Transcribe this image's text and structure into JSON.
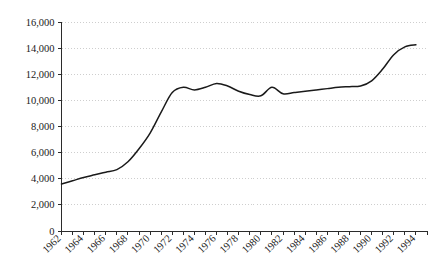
{
  "chart_data": {
    "type": "line",
    "title": "",
    "subtitle": "",
    "xlabel": "",
    "ylabel": "",
    "xlim": [
      1962,
      1995
    ],
    "ylim": [
      0,
      16000
    ],
    "grid": true,
    "legend": null,
    "legend_position": "none",
    "y_ticks": [
      0,
      2000,
      4000,
      6000,
      8000,
      10000,
      12000,
      14000,
      16000
    ],
    "y_tick_labels": [
      "0",
      "2,000",
      "4,000",
      "6,000",
      "8,000",
      "10,000",
      "12,000",
      "14,000",
      "16,000"
    ],
    "x_ticks": [
      1962,
      1963,
      1964,
      1965,
      1966,
      1967,
      1968,
      1969,
      1970,
      1971,
      1972,
      1973,
      1974,
      1975,
      1976,
      1977,
      1978,
      1979,
      1980,
      1981,
      1982,
      1983,
      1984,
      1985,
      1986,
      1987,
      1988,
      1989,
      1990,
      1991,
      1992,
      1993,
      1994
    ],
    "x_tick_labels": [
      "1962",
      "1964",
      "1966",
      "1968",
      "1970",
      "1972",
      "1974",
      "1976",
      "1978",
      "1980",
      "1982",
      "1984",
      "1986",
      "1988",
      "1990",
      "1992",
      "1994"
    ],
    "x_tick_label_years": [
      1962,
      1964,
      1966,
      1968,
      1970,
      1972,
      1974,
      1976,
      1978,
      1980,
      1982,
      1984,
      1986,
      1988,
      1990,
      1992,
      1994
    ],
    "x_tick_label_rotation": 45,
    "series": [
      {
        "name": "series-1",
        "color": "#1a1a1a",
        "x": [
          1962,
          1963,
          1964,
          1965,
          1966,
          1967,
          1968,
          1969,
          1970,
          1971,
          1972,
          1973,
          1974,
          1975,
          1976,
          1977,
          1978,
          1979,
          1980,
          1981,
          1982,
          1983,
          1984,
          1985,
          1986,
          1987,
          1988,
          1989,
          1990,
          1991,
          1992,
          1993,
          1994
        ],
        "values": [
          3600,
          3850,
          4100,
          4300,
          4500,
          4700,
          5300,
          6300,
          7500,
          9100,
          10600,
          11000,
          10800,
          11000,
          11300,
          11100,
          10700,
          10450,
          10350,
          11000,
          10500,
          10600,
          10700,
          10800,
          10900,
          11000,
          11050,
          11100,
          11500,
          12400,
          13500,
          14100,
          14250
        ]
      }
    ]
  }
}
